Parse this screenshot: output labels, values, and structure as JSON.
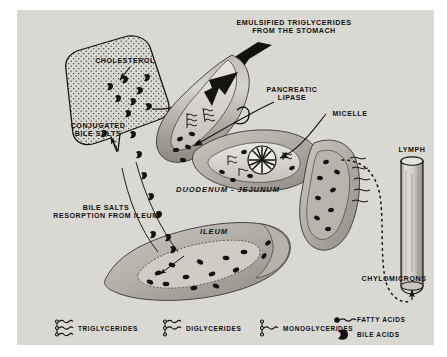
{
  "figure": {
    "background_color": "#ffffff",
    "panel_color": "#d9d8d3",
    "ink_color": "#14120f"
  },
  "labels": {
    "emulsified": "EMULSIFIED TRIGLYCERIDES\nFROM THE STOMACH",
    "cholesterol": "CHOLESTEROL",
    "conjugated_bile_salts": "CONJUGATED\nBILE SALTS",
    "pancreatic_lipase": "PANCREATIC\nLIPASE",
    "micelle": "MICELLE",
    "lymph": "LYMPH",
    "chylomicrons": "CHYLOMICRONS",
    "duodenum_jejunum": "DUODENUM - JEJUNUM",
    "ileum": "ILEUM",
    "bile_salts_resorption": "BILE SALTS\nRESORPTION FROM ILEUM"
  },
  "legend": {
    "items": [
      {
        "id": "triglycerides",
        "label": "TRIGLYCERIDES",
        "symbol": "glyceride-3-chain",
        "chains": 3
      },
      {
        "id": "diglycerides",
        "label": "DIGLYCERIDES",
        "symbol": "glyceride-2-chain",
        "chains": 2
      },
      {
        "id": "monoglycerides",
        "label": "MONOGLYCERIDES",
        "symbol": "glyceride-1-chain",
        "chains": 1
      },
      {
        "id": "fatty-acids",
        "label": "FATTY ACIDS",
        "symbol": "dot-with-wavy-tail"
      },
      {
        "id": "bile-acids",
        "label": "BILE ACIDS",
        "symbol": "solid-crescent"
      }
    ]
  }
}
